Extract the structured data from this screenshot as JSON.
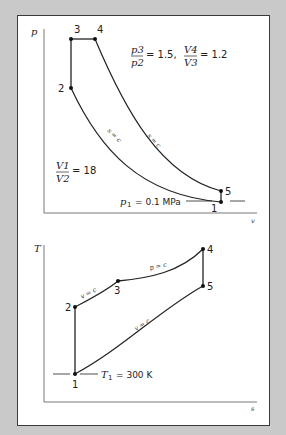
{
  "diagrams": {
    "pv": {
      "y_axis_label": "p",
      "x_axis_label": "v",
      "points": [
        {
          "id": "1",
          "label": "1"
        },
        {
          "id": "2",
          "label": "2"
        },
        {
          "id": "3",
          "label": "3"
        },
        {
          "id": "4",
          "label": "4"
        },
        {
          "id": "5",
          "label": "5"
        }
      ],
      "process_labels": {
        "compression": "s = c",
        "expansion": "s = c"
      },
      "ratio_p": {
        "num": "p3",
        "den": "p2",
        "value": "= 1.5,"
      },
      "ratio_v": {
        "num": "V4",
        "den": "V3",
        "value": "= 1.2"
      },
      "compression_ratio": {
        "num": "V1",
        "den": "V2",
        "value": "= 18"
      },
      "p1_label": "p1 = 0.1 MPa",
      "p1_sym": "p",
      "p1_sub": "1",
      "p1_value": "= 0.1 MPa"
    },
    "ts": {
      "y_axis_label": "T",
      "x_axis_label": "s",
      "points": [
        {
          "id": "1",
          "label": "1"
        },
        {
          "id": "2",
          "label": "2"
        },
        {
          "id": "3",
          "label": "3"
        },
        {
          "id": "4",
          "label": "4"
        },
        {
          "id": "5",
          "label": "5"
        }
      ],
      "process_labels": {
        "v23": "v = c",
        "p34": "p = c",
        "v51": "v = c"
      },
      "t1_sym": "T",
      "t1_sub": "1",
      "t1_value": "= 300 K"
    }
  }
}
